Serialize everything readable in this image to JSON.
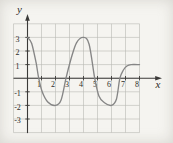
{
  "figure": {
    "x_axis_letter": "x",
    "y_axis_letter": "y",
    "x_tick_labels": [
      "1",
      "2",
      "3",
      "4",
      "5",
      "6",
      "7",
      "8"
    ],
    "y_tick_labels": [
      "3",
      "2",
      "1",
      "-1",
      "-2",
      "-3"
    ],
    "colors": {
      "background": "#f5f4f0",
      "grid": "#b9b9b4",
      "axis": "#3b3a38",
      "curve": "#868686",
      "text": "#2e2c29"
    }
  },
  "chart_data": {
    "type": "line",
    "title": "",
    "xlabel": "x",
    "ylabel": "y",
    "xlim": [
      -1,
      8
    ],
    "ylim": [
      -4,
      4
    ],
    "grid": true,
    "legend": false,
    "x_ticks": [
      1,
      2,
      3,
      4,
      5,
      6,
      7,
      8
    ],
    "y_ticks": [
      3,
      2,
      1,
      -1,
      -2,
      -3
    ],
    "series": [
      {
        "name": "oscillating-curve",
        "points": [
          [
            0,
            3
          ],
          [
            0.3,
            2.55
          ],
          [
            0.62,
            1.1
          ],
          [
            0.8,
            0
          ],
          [
            1.05,
            -1.0
          ],
          [
            1.45,
            -1.75
          ],
          [
            2,
            -2
          ],
          [
            2.4,
            -1.6
          ],
          [
            2.75,
            0
          ],
          [
            3.1,
            1.4
          ],
          [
            3.5,
            2.6
          ],
          [
            4,
            3
          ],
          [
            4.4,
            2.5
          ],
          [
            4.8,
            0
          ],
          [
            5.1,
            -1.3
          ],
          [
            5.5,
            -1.8
          ],
          [
            6,
            -2
          ],
          [
            6.35,
            -1.55
          ],
          [
            6.6,
            0
          ],
          [
            6.85,
            0.6
          ],
          [
            7.1,
            0.9
          ],
          [
            7.4,
            1
          ],
          [
            8,
            1
          ]
        ]
      }
    ],
    "key_features": {
      "maxima": [
        [
          0,
          3
        ],
        [
          4,
          3
        ]
      ],
      "minima": [
        [
          2,
          -2
        ],
        [
          6,
          -2
        ]
      ],
      "end_plateau_y": 1
    }
  }
}
